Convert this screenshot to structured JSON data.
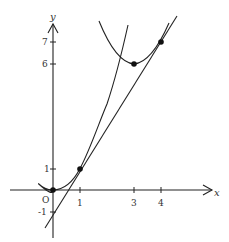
{
  "diagram": {
    "type": "function-graph",
    "axes": {
      "x_label": "x",
      "y_label": "y",
      "origin_label": "O",
      "x_ticks": [
        "1",
        "3",
        "4"
      ],
      "y_ticks": [
        "7",
        "6",
        "1",
        "-1"
      ]
    },
    "curves": [
      {
        "name": "parabola-1",
        "equation": "y = x^2"
      },
      {
        "name": "parabola-2",
        "equation": "y = (x-3)^2 + 6"
      },
      {
        "name": "common-tangent-line",
        "equation": "y = 2x - 1"
      }
    ],
    "points": [
      {
        "x": 0,
        "y": 0
      },
      {
        "x": 1,
        "y": 1
      },
      {
        "x": 3,
        "y": 6
      },
      {
        "x": 4,
        "y": 7
      }
    ],
    "colors": {
      "stroke": "#222222",
      "text": "#333333",
      "background": "#ffffff"
    }
  }
}
